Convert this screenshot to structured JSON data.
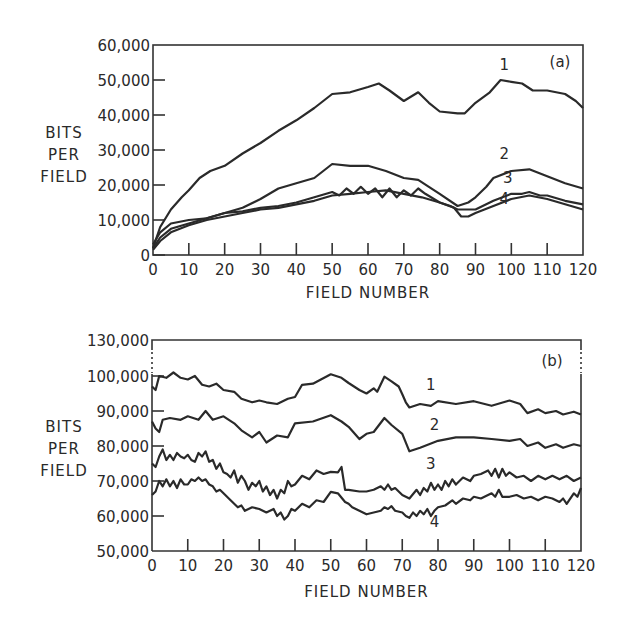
{
  "chart_data": [
    {
      "type": "line",
      "panel_label": "(a)",
      "title": "",
      "xlabel": "FIELD NUMBER",
      "ylabel": "BITS PER FIELD",
      "ylabel_lines": [
        "BITS",
        "PER",
        "FIELD"
      ],
      "xlim": [
        0,
        120
      ],
      "ylim": [
        0,
        60000
      ],
      "x_ticks": [
        0,
        10,
        20,
        30,
        40,
        50,
        60,
        70,
        80,
        90,
        100,
        110,
        120
      ],
      "y_ticks": [
        0,
        10000,
        20000,
        30000,
        40000,
        50000,
        60000
      ],
      "y_tick_labels": [
        "0",
        "10,000",
        "20,000",
        "30,000",
        "40,000",
        "50,000",
        "60,000"
      ],
      "grid": false,
      "series": [
        {
          "name": "1",
          "label_pos": [
            98,
            53000
          ],
          "x": [
            0,
            2,
            5,
            8,
            10,
            13,
            16,
            20,
            25,
            30,
            35,
            40,
            45,
            50,
            55,
            60,
            63,
            66,
            70,
            74,
            77,
            80,
            85,
            87,
            90,
            94,
            97,
            100,
            103,
            106,
            110,
            115,
            118,
            120
          ],
          "values": [
            2000,
            8000,
            13000,
            16500,
            18500,
            22000,
            24000,
            25500,
            29000,
            32000,
            35500,
            38500,
            42000,
            46000,
            46500,
            48000,
            49000,
            47000,
            44000,
            46500,
            43500,
            41000,
            40500,
            40500,
            43500,
            46500,
            50000,
            49500,
            49000,
            47000,
            47000,
            46000,
            44000,
            42000
          ]
        },
        {
          "name": "2",
          "label_pos": [
            98,
            27500
          ],
          "x": [
            0,
            2,
            5,
            10,
            15,
            20,
            25,
            30,
            35,
            40,
            45,
            50,
            55,
            60,
            65,
            70,
            74,
            77,
            80,
            85,
            88,
            90,
            93,
            95,
            100,
            105,
            110,
            115,
            120
          ],
          "values": [
            3000,
            6500,
            9000,
            10000,
            10500,
            12000,
            13500,
            16000,
            19000,
            20500,
            22000,
            26000,
            25500,
            25500,
            24000,
            22000,
            21500,
            19500,
            17500,
            14000,
            15000,
            16500,
            19500,
            22000,
            24000,
            24500,
            22500,
            20500,
            19000
          ]
        },
        {
          "name": "3",
          "label_pos": [
            99,
            20500
          ],
          "x": [
            0,
            2,
            5,
            10,
            15,
            20,
            25,
            30,
            35,
            40,
            45,
            50,
            52,
            54,
            56,
            58,
            60,
            62,
            64,
            66,
            68,
            70,
            72,
            74,
            76,
            80,
            83,
            85,
            87,
            90,
            95,
            100,
            103,
            105,
            108,
            110,
            115,
            120
          ],
          "values": [
            2000,
            5000,
            7500,
            9000,
            10500,
            12000,
            12500,
            13500,
            14000,
            15000,
            16500,
            18000,
            17000,
            19000,
            17500,
            19500,
            17500,
            19000,
            16500,
            19000,
            16500,
            18500,
            17000,
            19000,
            17500,
            15000,
            14000,
            13000,
            13000,
            13000,
            15500,
            17500,
            17500,
            18000,
            17000,
            17000,
            15500,
            14500
          ]
        },
        {
          "name": "4",
          "label_pos": [
            98,
            14500
          ],
          "x": [
            0,
            2,
            5,
            10,
            15,
            20,
            25,
            30,
            35,
            40,
            45,
            50,
            55,
            60,
            65,
            70,
            75,
            80,
            84,
            86,
            88,
            90,
            95,
            100,
            105,
            110,
            115,
            120
          ],
          "values": [
            1500,
            4000,
            6500,
            8500,
            10000,
            11000,
            12000,
            13000,
            13500,
            14500,
            15500,
            17000,
            17500,
            18000,
            18500,
            17500,
            16500,
            15000,
            13500,
            11000,
            11000,
            12000,
            14000,
            16000,
            17000,
            16000,
            14500,
            13000
          ]
        }
      ]
    },
    {
      "type": "line",
      "panel_label": "(b)",
      "title": "",
      "xlabel": "FIELD NUMBER",
      "ylabel": "BITS PER FIELD",
      "ylabel_lines": [
        "BITS",
        "PER",
        "FIELD"
      ],
      "xlim": [
        0,
        120
      ],
      "ylim": [
        50000,
        130000
      ],
      "axis_break": "between 100,000 and 130,000",
      "x_ticks": [
        0,
        10,
        20,
        30,
        40,
        50,
        60,
        70,
        80,
        90,
        100,
        110,
        120
      ],
      "y_ticks": [
        50000,
        60000,
        70000,
        80000,
        90000,
        100000,
        130000
      ],
      "y_tick_labels": [
        "50,000",
        "60,000",
        "70,000",
        "80,000",
        "90,000",
        "100,000",
        "130,000"
      ],
      "grid": false,
      "series": [
        {
          "name": "1",
          "label_pos": [
            78,
            96000
          ],
          "x": [
            0,
            1,
            2,
            4,
            6,
            8,
            10,
            12,
            14,
            16,
            18,
            20,
            23,
            25,
            28,
            30,
            32,
            35,
            38,
            40,
            42,
            45,
            50,
            53,
            55,
            58,
            60,
            62,
            63,
            65,
            67,
            69,
            70,
            71,
            72,
            75,
            78,
            80,
            85,
            90,
            95,
            100,
            103,
            105,
            108,
            110,
            113,
            115,
            118,
            120
          ],
          "values": [
            97000,
            96000,
            100000,
            99500,
            101000,
            99500,
            99000,
            100000,
            97500,
            97000,
            97800,
            96000,
            95500,
            93500,
            92500,
            93000,
            92500,
            92000,
            93500,
            94000,
            97500,
            97800,
            100500,
            99500,
            98000,
            96000,
            95000,
            96500,
            95500,
            99800,
            98500,
            97000,
            94800,
            92500,
            91000,
            92000,
            91500,
            92800,
            92000,
            92800,
            91500,
            93000,
            92000,
            89400,
            90500,
            89400,
            90000,
            89000,
            89800,
            89000
          ]
        },
        {
          "name": "2",
          "label_pos": [
            79,
            84500
          ],
          "x": [
            0,
            1,
            2,
            3,
            5,
            8,
            10,
            13,
            15,
            17,
            20,
            23,
            25,
            28,
            30,
            32,
            35,
            38,
            40,
            45,
            50,
            53,
            55,
            58,
            60,
            62,
            65,
            67,
            70,
            72,
            75,
            80,
            85,
            90,
            95,
            100,
            103,
            105,
            108,
            110,
            113,
            115,
            118,
            120
          ],
          "values": [
            87000,
            85000,
            84000,
            87500,
            88000,
            87500,
            88500,
            87500,
            90000,
            87500,
            88500,
            86500,
            84500,
            82500,
            84000,
            81000,
            83000,
            82500,
            86500,
            87000,
            88800,
            87000,
            85500,
            82000,
            83500,
            84000,
            88000,
            86000,
            83500,
            78500,
            79500,
            81500,
            82500,
            82500,
            82000,
            81500,
            82000,
            80000,
            81000,
            79500,
            80500,
            79500,
            80500,
            80000
          ]
        },
        {
          "name": "3",
          "label_pos": [
            78,
            73500
          ],
          "x": [
            0,
            1,
            2,
            3,
            4,
            5,
            6,
            7,
            8,
            9,
            10,
            11,
            12,
            13,
            14,
            15,
            16,
            17,
            18,
            19,
            20,
            21,
            22,
            23,
            24,
            25,
            26,
            27,
            28,
            29,
            30,
            31,
            32,
            33,
            34,
            35,
            36,
            37,
            38,
            39,
            40,
            42,
            44,
            46,
            48,
            50,
            52,
            53,
            54,
            55,
            58,
            60,
            62,
            64,
            65,
            66,
            67,
            68,
            70,
            72,
            74,
            75,
            76,
            77,
            78,
            79,
            80,
            81,
            82,
            83,
            84,
            85,
            87,
            89,
            90,
            92,
            94,
            95,
            96,
            97,
            98,
            99,
            100,
            102,
            104,
            106,
            108,
            110,
            112,
            114,
            116,
            118,
            120
          ],
          "values": [
            75000,
            74000,
            77000,
            79000,
            76000,
            77500,
            76000,
            78000,
            77000,
            76500,
            77500,
            76000,
            75500,
            78000,
            77000,
            78500,
            75500,
            76000,
            73500,
            75000,
            72500,
            72000,
            71000,
            73000,
            69500,
            71500,
            70000,
            67500,
            69500,
            68500,
            70000,
            67000,
            68500,
            66000,
            67500,
            65000,
            67500,
            66500,
            70000,
            68500,
            69000,
            71500,
            70500,
            73000,
            72000,
            72600,
            72500,
            74000,
            67500,
            67500,
            67000,
            67000,
            67500,
            68500,
            67500,
            69000,
            67500,
            68000,
            66000,
            65000,
            67500,
            66000,
            68000,
            67000,
            69500,
            67500,
            69000,
            67500,
            70000,
            68500,
            70500,
            69000,
            71000,
            70000,
            71500,
            72000,
            73000,
            71500,
            73500,
            71000,
            73500,
            71500,
            72500,
            71000,
            71500,
            70000,
            71500,
            70500,
            71500,
            70500,
            71500,
            70000,
            71000
          ]
        },
        {
          "name": "4",
          "label_pos": [
            79,
            57000
          ],
          "x": [
            0,
            1,
            2,
            3,
            4,
            5,
            6,
            7,
            8,
            9,
            10,
            11,
            12,
            13,
            14,
            15,
            16,
            17,
            18,
            19,
            20,
            22,
            24,
            25,
            26,
            28,
            30,
            32,
            34,
            35,
            36,
            37,
            38,
            39,
            40,
            42,
            44,
            46,
            48,
            50,
            52,
            54,
            55,
            56,
            58,
            60,
            62,
            64,
            65,
            66,
            67,
            68,
            70,
            71,
            72,
            73,
            74,
            75,
            76,
            77,
            78,
            79,
            80,
            82,
            84,
            85,
            87,
            89,
            90,
            92,
            95,
            96,
            97,
            98,
            100,
            102,
            104,
            106,
            108,
            110,
            112,
            114,
            115,
            116,
            118,
            119,
            120
          ],
          "values": [
            66000,
            67000,
            70000,
            68500,
            70500,
            68500,
            70000,
            68000,
            70500,
            69000,
            69000,
            70500,
            70000,
            71000,
            70000,
            70500,
            69000,
            68500,
            67000,
            67500,
            66500,
            64500,
            62500,
            63000,
            61500,
            62500,
            62000,
            61000,
            62000,
            60000,
            61000,
            59000,
            60000,
            62000,
            61500,
            63500,
            62500,
            64500,
            64000,
            66900,
            66500,
            64000,
            63500,
            62500,
            61500,
            60500,
            61000,
            61500,
            62500,
            62000,
            62800,
            61500,
            61000,
            60000,
            59500,
            61000,
            60000,
            61500,
            60500,
            62000,
            60000,
            61500,
            62500,
            63000,
            64500,
            63500,
            65000,
            64500,
            65500,
            65000,
            66500,
            65500,
            67500,
            65500,
            65500,
            66000,
            65000,
            65500,
            64500,
            65500,
            65000,
            64000,
            65000,
            63500,
            66500,
            65500,
            68000
          ]
        }
      ]
    }
  ]
}
